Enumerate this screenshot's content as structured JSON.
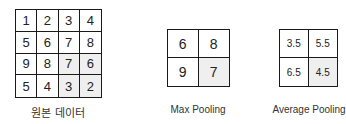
{
  "original": {
    "label": "원본 데이터",
    "cells": [
      {
        "value": "1",
        "shaded": false
      },
      {
        "value": "2",
        "shaded": false
      },
      {
        "value": "3",
        "shaded": false
      },
      {
        "value": "4",
        "shaded": false
      },
      {
        "value": "5",
        "shaded": false
      },
      {
        "value": "6",
        "shaded": false
      },
      {
        "value": "7",
        "shaded": false
      },
      {
        "value": "8",
        "shaded": false
      },
      {
        "value": "9",
        "shaded": false
      },
      {
        "value": "8",
        "shaded": false
      },
      {
        "value": "7",
        "shaded": true
      },
      {
        "value": "6",
        "shaded": true
      },
      {
        "value": "5",
        "shaded": false
      },
      {
        "value": "4",
        "shaded": false
      },
      {
        "value": "3",
        "shaded": true
      },
      {
        "value": "2",
        "shaded": true
      }
    ]
  },
  "max_pooling": {
    "label": "Max Pooling",
    "cells": [
      {
        "value": "6",
        "shaded": false
      },
      {
        "value": "8",
        "shaded": false
      },
      {
        "value": "9",
        "shaded": false
      },
      {
        "value": "7",
        "shaded": true
      }
    ]
  },
  "average_pooling": {
    "label": "Average Pooling",
    "cells": [
      {
        "value": "3.5",
        "shaded": false
      },
      {
        "value": "5.5",
        "shaded": false
      },
      {
        "value": "6.5",
        "shaded": false
      },
      {
        "value": "4.5",
        "shaded": true
      }
    ]
  },
  "colors": {
    "shaded_cell": "#efefef",
    "border": "#1a1a1a"
  }
}
